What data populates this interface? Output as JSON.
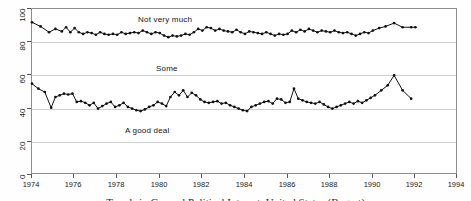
{
  "chart_data": {
    "type": "line",
    "title": "",
    "subtitle": "",
    "xlabel": "",
    "ylabel": "",
    "xlim": [
      1974,
      1994
    ],
    "ylim": [
      0,
      100
    ],
    "grid": true,
    "legend_position": "inline-annotations",
    "xticks": [
      1974,
      1976,
      1978,
      1980,
      1982,
      1984,
      1986,
      1988,
      1990,
      1992,
      1994
    ],
    "yticks": [
      0,
      20,
      40,
      60,
      80,
      100
    ],
    "annotations": [
      {
        "text": "Not very much",
        "x": 1980.3,
        "y": 95
      },
      {
        "text": "Some",
        "x": 1981.2,
        "y": 66
      },
      {
        "text": "A good deal",
        "x": 1979.3,
        "y": 29
      }
    ],
    "series": [
      {
        "name": "Not very much",
        "marker": "filled-circle",
        "x": [
          1974.0,
          1974.4,
          1974.8,
          1975.1,
          1975.4,
          1975.6,
          1975.8,
          1976.0,
          1976.2,
          1976.4,
          1976.6,
          1976.8,
          1977.0,
          1977.2,
          1977.4,
          1977.6,
          1977.8,
          1978.0,
          1978.2,
          1978.4,
          1978.6,
          1978.8,
          1979.0,
          1979.2,
          1979.4,
          1979.6,
          1979.8,
          1980.0,
          1980.2,
          1980.4,
          1980.6,
          1980.8,
          1981.0,
          1981.2,
          1981.4,
          1981.6,
          1981.8,
          1982.0,
          1982.2,
          1982.4,
          1982.6,
          1982.8,
          1983.0,
          1983.2,
          1983.4,
          1983.6,
          1983.8,
          1984.0,
          1984.2,
          1984.4,
          1984.6,
          1984.8,
          1985.0,
          1985.2,
          1985.4,
          1985.6,
          1985.8,
          1986.0,
          1986.2,
          1986.4,
          1986.6,
          1986.8,
          1987.0,
          1987.2,
          1987.4,
          1987.6,
          1987.8,
          1988.0,
          1988.2,
          1988.4,
          1988.6,
          1988.8,
          1989.0,
          1989.2,
          1989.4,
          1989.6,
          1989.8,
          1990.0,
          1990.3,
          1990.6,
          1991.0,
          1991.4,
          1991.8,
          1992.0
        ],
        "y": [
          92.0,
          89.5,
          86.0,
          88.0,
          86.5,
          89.0,
          86.0,
          88.5,
          86.0,
          85.0,
          86.0,
          85.5,
          84.5,
          86.0,
          85.0,
          84.5,
          85.0,
          84.5,
          86.0,
          85.0,
          85.5,
          86.0,
          85.5,
          87.0,
          86.0,
          85.0,
          86.0,
          85.5,
          84.0,
          83.0,
          84.0,
          83.5,
          84.0,
          85.0,
          84.5,
          86.0,
          88.0,
          87.0,
          89.0,
          88.5,
          87.0,
          88.0,
          87.0,
          86.5,
          86.0,
          87.5,
          86.0,
          85.0,
          86.5,
          86.0,
          85.5,
          85.0,
          86.0,
          85.0,
          84.0,
          85.0,
          84.5,
          85.0,
          87.0,
          86.0,
          87.5,
          86.5,
          88.0,
          87.0,
          86.0,
          87.0,
          86.5,
          86.0,
          87.0,
          86.0,
          85.5,
          86.0,
          85.0,
          84.0,
          85.0,
          86.0,
          85.5,
          87.0,
          88.5,
          89.5,
          91.5,
          89.0,
          89.0,
          89.0
        ]
      },
      {
        "name": "Some / A good deal",
        "marker": "filled-circle",
        "x": [
          1974.0,
          1974.3,
          1974.6,
          1974.9,
          1975.1,
          1975.3,
          1975.5,
          1975.7,
          1975.9,
          1976.1,
          1976.3,
          1976.5,
          1976.7,
          1976.9,
          1977.1,
          1977.3,
          1977.5,
          1977.7,
          1977.9,
          1978.1,
          1978.3,
          1978.5,
          1978.7,
          1978.9,
          1979.1,
          1979.3,
          1979.5,
          1979.7,
          1979.9,
          1980.1,
          1980.3,
          1980.5,
          1980.7,
          1980.9,
          1981.1,
          1981.3,
          1981.5,
          1981.7,
          1981.9,
          1982.1,
          1982.3,
          1982.5,
          1982.7,
          1982.9,
          1983.1,
          1983.3,
          1983.5,
          1983.7,
          1983.9,
          1984.1,
          1984.3,
          1984.5,
          1984.7,
          1984.9,
          1985.1,
          1985.3,
          1985.5,
          1985.7,
          1985.9,
          1986.1,
          1986.3,
          1986.5,
          1986.7,
          1986.9,
          1987.1,
          1987.3,
          1987.5,
          1987.7,
          1987.9,
          1988.1,
          1988.3,
          1988.5,
          1988.7,
          1988.9,
          1989.1,
          1989.3,
          1989.5,
          1989.7,
          1989.9,
          1990.1,
          1990.4,
          1990.7,
          1991.0,
          1991.4,
          1991.8
        ],
        "y": [
          55.0,
          52.0,
          50.0,
          40.5,
          47.0,
          48.0,
          49.0,
          48.5,
          49.0,
          44.0,
          44.5,
          43.5,
          42.0,
          43.5,
          40.0,
          41.5,
          43.0,
          44.0,
          41.0,
          42.0,
          43.5,
          41.0,
          40.0,
          39.0,
          38.5,
          39.5,
          41.0,
          42.0,
          44.0,
          43.0,
          41.5,
          47.0,
          50.0,
          48.0,
          51.0,
          47.0,
          49.5,
          48.0,
          45.5,
          44.0,
          43.5,
          44.0,
          44.5,
          43.0,
          43.5,
          42.0,
          41.0,
          40.0,
          39.0,
          38.5,
          41.0,
          42.0,
          43.0,
          44.0,
          44.5,
          43.0,
          46.0,
          45.5,
          43.5,
          44.0,
          52.0,
          46.0,
          45.0,
          44.0,
          43.5,
          43.0,
          44.0,
          42.5,
          41.0,
          40.0,
          41.0,
          42.0,
          43.0,
          44.0,
          43.0,
          44.5,
          43.5,
          45.0,
          46.5,
          48.0,
          51.0,
          54.0,
          60.0,
          51.0,
          46.0
        ]
      }
    ]
  },
  "axes": {
    "y_tick_labels": [
      "0",
      "20",
      "40",
      "60",
      "80",
      "100"
    ],
    "x_tick_labels": [
      "1974",
      "1976",
      "1978",
      "1980",
      "1982",
      "1984",
      "1986",
      "1988",
      "1990",
      "1992",
      "1994"
    ]
  },
  "labels": {
    "not_very_much": "Not very much",
    "some": "Some",
    "a_good_deal": "A good deal"
  },
  "caption": "Trends in General Political Interest, United States (Bogart)"
}
